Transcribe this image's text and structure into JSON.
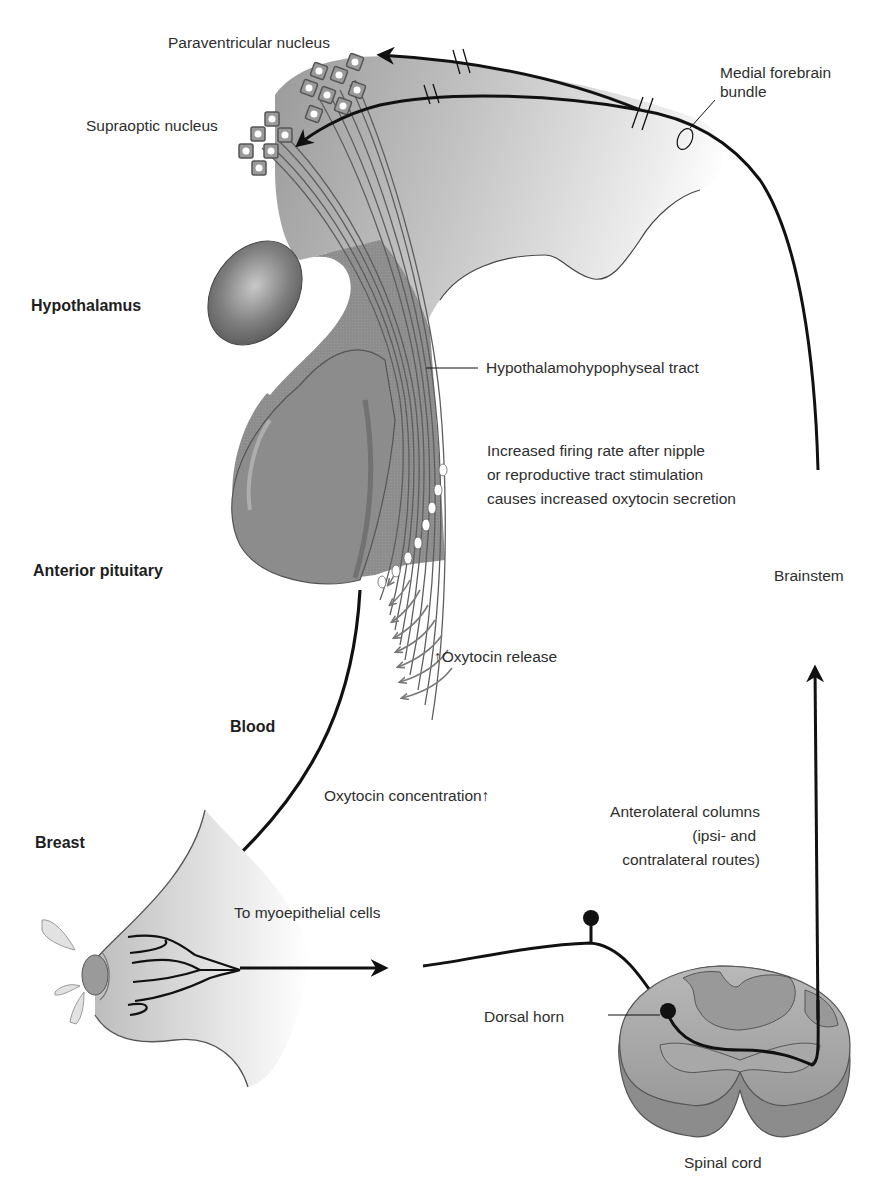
{
  "diagram": {
    "colors": {
      "tissue_gray": "#8f8f8f",
      "tissue_light": "#d9d9d9",
      "pituitary_dark": "#6e6e6e",
      "line_black": "#111111",
      "fiber_gray": "#6a6a6a",
      "background": "#ffffff"
    },
    "region_labels": {
      "hypothalamus": "Hypothalamus",
      "anterior_pituitary": "Anterior pituitary",
      "blood": "Blood",
      "breast": "Breast"
    },
    "structure_labels": {
      "paraventricular_nucleus": "Paraventricular nucleus",
      "supraoptic_nucleus": "Supraoptic nucleus",
      "medial_forebrain_bundle_line1": "Medial forebrain",
      "medial_forebrain_bundle_line2": "bundle",
      "hypothalamohypophyseal_tract": "Hypothalamohypophyseal tract",
      "brainstem": "Brainstem",
      "dorsal_horn": "Dorsal horn",
      "spinal_cord": "Spinal cord"
    },
    "annotations": {
      "firing_line1": "Increased firing rate after nipple",
      "firing_line2": "or reproductive tract stimulation",
      "firing_line3": "causes increased oxytocin secretion",
      "oxytocin_release": "↑Oxytocin release",
      "oxytocin_concentration": "Oxytocin concentration↑",
      "myoepithelial": "To myoepithelial cells",
      "anterolateral_line1": "Anterolateral columns",
      "anterolateral_line2": "(ipsi- and",
      "anterolateral_line3": "contralateral routes)"
    },
    "flow": [
      "Nipple stimulation",
      "Afferent nerve",
      "Dorsal horn (spinal cord)",
      "Anterolateral columns",
      "Brainstem",
      "Medial forebrain bundle",
      "Paraventricular & Supraoptic nuclei",
      "Hypothalamohypophyseal tract",
      "Posterior pituitary oxytocin release",
      "Blood",
      "Myoepithelial cells of breast"
    ]
  }
}
